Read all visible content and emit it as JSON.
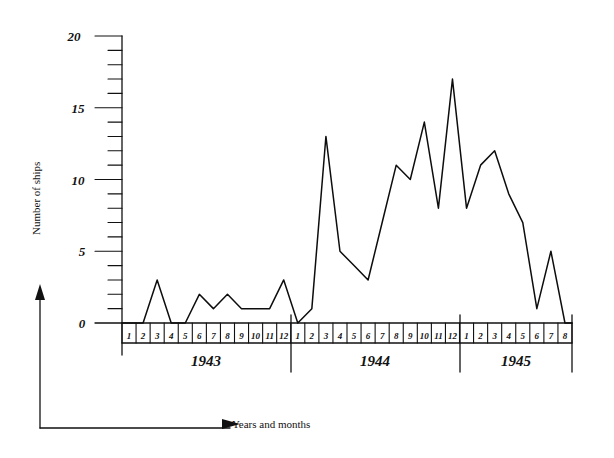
{
  "figure": {
    "y_axis_title": "Number of ships",
    "x_axis_title": "Years and months",
    "y_tick_labels": [
      "0",
      "5",
      "10",
      "15",
      "20"
    ],
    "year_labels": [
      "1943",
      "1944",
      "1945"
    ],
    "month_labels_1943": [
      "1",
      "2",
      "3",
      "4",
      "5",
      "6",
      "7",
      "8",
      "9",
      "10",
      "11",
      "12"
    ],
    "month_labels_1944": [
      "1",
      "2",
      "3",
      "4",
      "5",
      "6",
      "7",
      "8",
      "9",
      "10",
      "11",
      "12"
    ],
    "month_labels_1945": [
      "1",
      "2",
      "3",
      "4",
      "5",
      "6",
      "7",
      "8"
    ],
    "line_color": "#0d0d0d",
    "axis_color": "#111111",
    "background_color": "#ffffff"
  },
  "chart_data": {
    "type": "line",
    "title": "",
    "xlabel": "Years and months",
    "ylabel": "Number of ships",
    "ylim": [
      0,
      20
    ],
    "y_ticks_major": [
      0,
      5,
      10,
      15,
      20
    ],
    "y_minor_tick_step": 1,
    "grid": false,
    "legend": "none",
    "x_groups": [
      {
        "year": "1943",
        "months": [
          "1",
          "2",
          "3",
          "4",
          "5",
          "6",
          "7",
          "8",
          "9",
          "10",
          "11",
          "12"
        ]
      },
      {
        "year": "1944",
        "months": [
          "1",
          "2",
          "3",
          "4",
          "5",
          "6",
          "7",
          "8",
          "9",
          "10",
          "11",
          "12"
        ]
      },
      {
        "year": "1945",
        "months": [
          "1",
          "2",
          "3",
          "4",
          "5",
          "6",
          "7",
          "8"
        ]
      }
    ],
    "categories": [
      "1943-1",
      "1943-2",
      "1943-3",
      "1943-4",
      "1943-5",
      "1943-6",
      "1943-7",
      "1943-8",
      "1943-9",
      "1943-10",
      "1943-11",
      "1943-12",
      "1944-1",
      "1944-2",
      "1944-3",
      "1944-4",
      "1944-5",
      "1944-6",
      "1944-7",
      "1944-8",
      "1944-9",
      "1944-10",
      "1944-11",
      "1944-12",
      "1945-1",
      "1945-2",
      "1945-3",
      "1945-4",
      "1945-5",
      "1945-6",
      "1945-7",
      "1945-8"
    ],
    "values": [
      0,
      0,
      3,
      0,
      0,
      2,
      1,
      2,
      1,
      1,
      1,
      3,
      0,
      1,
      13,
      5,
      4,
      3,
      7,
      11,
      10,
      14,
      8,
      17,
      8,
      11,
      12,
      9,
      7,
      1,
      5,
      0
    ]
  }
}
